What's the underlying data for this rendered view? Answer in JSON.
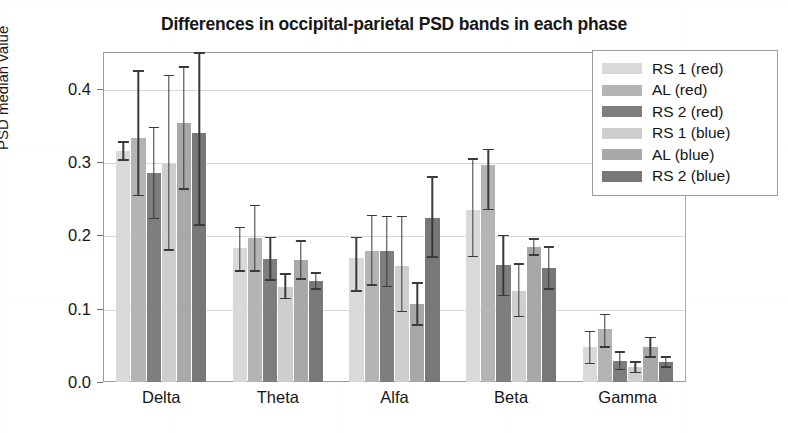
{
  "chart_data": {
    "type": "bar",
    "title": "Differences in occipital-parietal PSD bands in each phase",
    "xlabel": "",
    "ylabel": "PSD median value",
    "categories": [
      "Delta",
      "Theta",
      "Alfa",
      "Beta",
      "Gamma"
    ],
    "ylim": [
      0.0,
      0.45
    ],
    "yticks": [
      0.0,
      0.1,
      0.2,
      0.3,
      0.4
    ],
    "ytick_labels": [
      "0.0",
      "0.1",
      "0.2",
      "0.3",
      "0.4"
    ],
    "grid": true,
    "legend_position": "upper right",
    "errorbars": true,
    "series": [
      {
        "name": "RS 1 (red)",
        "color": "#d9d9d9",
        "values": [
          0.315,
          0.183,
          0.169,
          0.235,
          0.048
        ],
        "err_low": [
          0.013,
          0.033,
          0.046,
          0.065,
          0.024
        ],
        "err_high": [
          0.013,
          0.029,
          0.029,
          0.07,
          0.022
        ]
      },
      {
        "name": "AL (red)",
        "color": "#b4b4b4",
        "values": [
          0.333,
          0.197,
          0.178,
          0.296,
          0.072
        ],
        "err_low": [
          0.08,
          0.047,
          0.047,
          0.062,
          0.025
        ],
        "err_high": [
          0.092,
          0.045,
          0.05,
          0.022,
          0.021
        ]
      },
      {
        "name": "RS 2 (red)",
        "color": "#7e7e7e",
        "values": [
          0.285,
          0.168,
          0.178,
          0.159,
          0.029
        ],
        "err_low": [
          0.063,
          0.03,
          0.049,
          0.042,
          0.013
        ]
      },
      {
        "name": "RS 1 (blue)",
        "color": "#cecece",
        "values": [
          0.297,
          0.13,
          0.158,
          0.124,
          0.02
        ],
        "err_low": [
          0.118,
          0.017,
          0.063,
          0.036,
          0.008
        ],
        "err_high": [
          0.122,
          0.018,
          0.069,
          0.038,
          0.008
        ]
      },
      {
        "name": "AL (blue)",
        "color": "#a8a8a8",
        "values": [
          0.353,
          0.167,
          0.106,
          0.184,
          0.048
        ],
        "err_low": [
          0.091,
          0.028,
          0.029,
          0.012,
          0.015
        ],
        "err_high": [
          0.078,
          0.026,
          0.03,
          0.012,
          0.014
        ]
      },
      {
        "name": "RS 2 (blue)",
        "color": "#787878",
        "values": [
          0.34,
          0.138,
          0.223,
          0.155,
          0.027
        ],
        "err_low": [
          0.127,
          0.012,
          0.054,
          0.029,
          0.008
        ],
        "err_high": [
          0.11,
          0.012,
          0.058,
          0.03,
          0.008
        ]
      }
    ]
  },
  "legend": {
    "items": [
      {
        "label": "RS 1 (red)",
        "color": "#d9d9d9"
      },
      {
        "label": "AL (red)",
        "color": "#b4b4b4"
      },
      {
        "label": "RS 2 (red)",
        "color": "#7e7e7e"
      },
      {
        "label": "RS 1 (blue)",
        "color": "#cecece"
      },
      {
        "label": "AL (blue)",
        "color": "#a8a8a8"
      },
      {
        "label": "RS 2 (blue)",
        "color": "#787878"
      }
    ]
  }
}
